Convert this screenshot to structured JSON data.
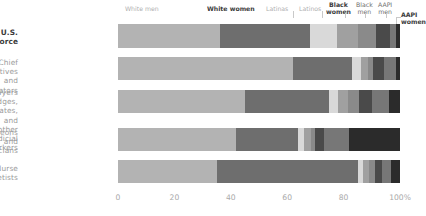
{
  "chart_data": {
    "type": "bar",
    "subtype": "stacked-horizontal-100",
    "title": "",
    "xlabel": "",
    "ylabel": "",
    "xlim": [
      0,
      100
    ],
    "grid": false,
    "legend_position": "top",
    "tick_labels": [
      "0",
      "20",
      "40",
      "60",
      "80",
      "100%"
    ],
    "tick_values": [
      0,
      20,
      40,
      60,
      80,
      100
    ],
    "categories": [
      "U.S. workforce",
      "Chief executives and legislators",
      "Lawyers and judges, magistrates, and other judicial workers",
      "Surgeons and physicians",
      "Nurse anesthetists"
    ],
    "series": [
      {
        "name": "White men",
        "color": "#b3b3b3",
        "values": [
          36.0,
          62.0,
          45.0,
          42.0,
          35.0
        ]
      },
      {
        "name": "White women",
        "color": "#6e6e6e",
        "values": [
          32.0,
          21.0,
          30.0,
          22.0,
          50.0
        ]
      },
      {
        "name": "Latinos",
        "color": "#d9d9d9",
        "values": [
          9.5,
          3.0,
          3.0,
          2.0,
          2.0
        ]
      },
      {
        "name": "Latinas",
        "color": "#a0a0a0",
        "values": [
          7.5,
          2.5,
          3.5,
          2.5,
          2.0
        ]
      },
      {
        "name": "Black women",
        "color": "#8a8a8a",
        "values": [
          6.5,
          2.0,
          4.0,
          1.5,
          2.0
        ]
      },
      {
        "name": "Black men",
        "color": "#4a4a4a",
        "values": [
          5.0,
          4.0,
          4.5,
          3.0,
          2.5
        ]
      },
      {
        "name": "AAPI men",
        "color": "#777777",
        "values": [
          2.0,
          4.0,
          6.0,
          9.0,
          3.5
        ]
      },
      {
        "name": "AAPI women",
        "color": "#2b2b2b",
        "values": [
          1.5,
          1.5,
          4.0,
          18.0,
          3.0
        ]
      }
    ],
    "annotations": [
      {
        "label": "White men",
        "style": "light"
      },
      {
        "label": "White women",
        "style": "dark"
      },
      {
        "label": "Latinas",
        "style": "light"
      },
      {
        "label": "Latinos",
        "style": "light"
      },
      {
        "label": "Black\nwomen",
        "style": "dark"
      },
      {
        "label": "Black\nmen",
        "style": "mid"
      },
      {
        "label": "AAPI\nmen",
        "style": "mid"
      },
      {
        "label": "AAPI\nwomen",
        "style": "dark"
      }
    ]
  },
  "rows": {
    "r0": "U.S. workforce",
    "r1": "Chief executives and\nlegislators",
    "r2": "Lawyers and judges,\nmagistrates, and\nother judicial workers",
    "r3": "Surgeons and physicians",
    "r4": "Nurse anesthetists"
  },
  "legend": {
    "white_men": "White men",
    "white_women": "White women",
    "latinas": "Latinas",
    "latinos": "Latinos",
    "black_women": "Black\nwomen",
    "black_men": "Black\nmen",
    "aapi_men": "AAPI\nmen",
    "aapi_women": "AAPI\nwomen"
  },
  "axis": {
    "t0": "0",
    "t1": "20",
    "t2": "40",
    "t3": "60",
    "t4": "80",
    "t5": "100%"
  }
}
